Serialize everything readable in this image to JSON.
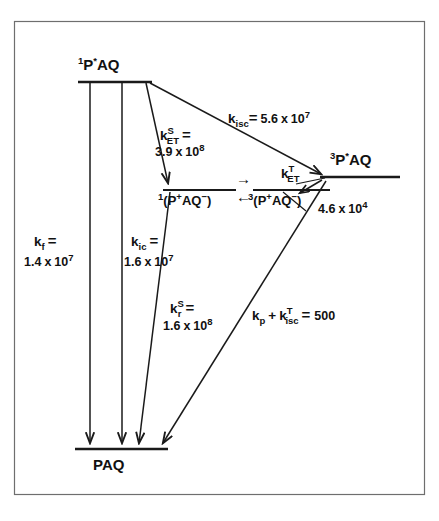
{
  "figure": {
    "caption_fragment": "",
    "border_color": "#6e6e6e",
    "ink_color": "#111111",
    "background": "#ffffff"
  },
  "states": {
    "excited_singlet": {
      "label_plain": "1P*AQ",
      "multiplicity": "1",
      "base": "P",
      "star": "*",
      "tail": "AQ"
    },
    "excited_triplet": {
      "label_plain": "3P*AQ",
      "multiplicity": "3",
      "base": "P",
      "star": "*",
      "tail": "AQ"
    },
    "ct_singlet": {
      "label_plain": "1(P+AQ-)",
      "multiplicity": "1",
      "open": "(",
      "donor": "P",
      "donor_charge": "+",
      "acceptor": "AQ",
      "acceptor_charge": "−",
      "close": ")"
    },
    "ct_triplet": {
      "label_plain": "3(P+AQ-)",
      "multiplicity": "3",
      "open": "(",
      "donor": "P",
      "donor_charge": "+",
      "acceptor": "AQ",
      "acceptor_charge": "−",
      "close": ")"
    },
    "ground": {
      "label_plain": "PAQ"
    }
  },
  "interconversion": {
    "forward_arrow": "→",
    "reverse_arrow": "←"
  },
  "rates": {
    "k_isc": {
      "symbol": "k",
      "subscript": "isc",
      "superscript": "",
      "equals": "=",
      "mantissa": "5.6",
      "times": "x",
      "base": "10",
      "exponent": "7",
      "value_plain": "5.6 x 10^7"
    },
    "k_et_s": {
      "symbol": "k",
      "subscript": "ET",
      "superscript": "S",
      "equals": "=",
      "mantissa": "3.9",
      "times": "x",
      "base": "10",
      "exponent": "8",
      "value_plain": "3.9 x 10^8"
    },
    "k_et_t": {
      "symbol": "k",
      "subscript": "ET",
      "superscript": "T",
      "equals": "",
      "mantissa": "4.6",
      "times": "x",
      "base": "10",
      "exponent": "4",
      "value_plain": "4.6 x 10^4"
    },
    "k_f": {
      "symbol": "k",
      "subscript": "f",
      "superscript": "",
      "equals": "=",
      "mantissa": "1.4",
      "times": "x",
      "base": "10",
      "exponent": "7",
      "value_plain": "1.4 x 10^7"
    },
    "k_ic": {
      "symbol": "k",
      "subscript": "ic",
      "superscript": "",
      "equals": "=",
      "mantissa": "1.6",
      "times": "x",
      "base": "10",
      "exponent": "7",
      "value_plain": "1.6 x 10^7"
    },
    "k_r_s": {
      "symbol": "k",
      "subscript": "r",
      "superscript": "S",
      "equals": "=",
      "mantissa": "1.6",
      "times": "x",
      "base": "10",
      "exponent": "8",
      "value_plain": "1.6 x 10^8"
    },
    "k_p_isc_t": {
      "symbol1": "k",
      "subscript1": "p",
      "plus": "+",
      "symbol2": "k",
      "subscript2": "isc",
      "superscript2": "T",
      "equals": "=",
      "value": "500",
      "value_plain": "500"
    }
  }
}
